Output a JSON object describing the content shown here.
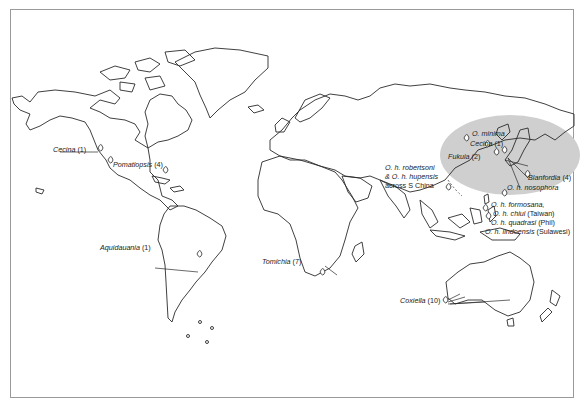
{
  "figure": {
    "type": "world-map",
    "highlight_region": "East Asia (shaded ellipse)",
    "colors": {
      "coast": "#2a2a2a",
      "highlight": "#cfcfcf",
      "frame": "#9a9a9a",
      "text": "#222222"
    }
  },
  "labels": [
    {
      "id": "cecina-na",
      "genus": "Cecina",
      "count": "(1)"
    },
    {
      "id": "pomatiopsis",
      "genus": "Pomatiopsis",
      "count": "(4)"
    },
    {
      "id": "aquidauania",
      "genus": "Aquidauania",
      "count": "(1)"
    },
    {
      "id": "tomichia",
      "genus": "Tomichia",
      "count": "(7)"
    },
    {
      "id": "coxiella",
      "genus": "Coxiella",
      "count": "(10)"
    },
    {
      "id": "o-minima",
      "genus": "O. minima",
      "count": ""
    },
    {
      "id": "cecina-asia",
      "genus": "Cecina",
      "count": "(1)"
    },
    {
      "id": "fukuia",
      "genus": "Fukuia",
      "count": "(2)"
    },
    {
      "id": "blanfordia",
      "genus": "Blanfordia",
      "count": "(4)"
    },
    {
      "id": "o-h-nosophora",
      "genus": "O. h. nosophora",
      "count": ""
    },
    {
      "id": "o-h-robertsoni",
      "line1": "O. h. robertsoni",
      "line2": "& O. h. hupensis",
      "line3": "across S China"
    },
    {
      "id": "o-h-formosana",
      "genus": "O. h. formosana,",
      "count": ""
    },
    {
      "id": "o-h-chiui",
      "genus": "O. h. chiui",
      "count": "(Taiwan)"
    },
    {
      "id": "o-h-quadrasi",
      "genus": "O. h. quadrasi",
      "count": "(Phil)"
    },
    {
      "id": "o-h-lindoensis",
      "genus": "O. h. lindoensis",
      "count": "(Sulawesi)"
    }
  ]
}
